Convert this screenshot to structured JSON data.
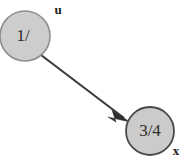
{
  "diagram": {
    "type": "directed-graph",
    "background_color": "#ffffff",
    "node_fill_color": "#cdcdcd",
    "node_stroke_color": "#4a4a4a",
    "edge_color": "#3a3a3a",
    "text_color": "#2b2b2b",
    "nodes": [
      {
        "id": "node-u",
        "value_label": "1/",
        "vertex_label": "u",
        "cx": 25,
        "cy": 36,
        "r": 25
      },
      {
        "id": "node-x",
        "value_label": "3/4",
        "vertex_label": "x",
        "cx": 150,
        "cy": 131,
        "r": 24
      }
    ],
    "edges": [
      {
        "id": "edge-u-to-x",
        "from": "u",
        "to": "x",
        "directed": true,
        "arrowhead": "solid-triangle"
      }
    ]
  }
}
